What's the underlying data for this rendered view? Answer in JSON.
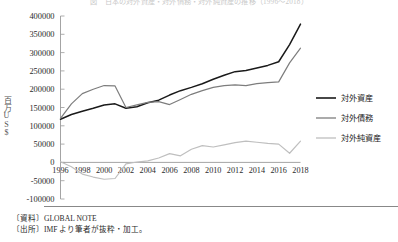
{
  "chart_data": {
    "type": "line",
    "title": "図　日本の対外資産・対外債務・対外純資産の推移（1996〜2018）",
    "xlabel": "",
    "ylabel": "百万US$",
    "ylim": [
      -100000,
      400000
    ],
    "xlim": [
      1996,
      2018
    ],
    "yticks": [
      400000,
      350000,
      300000,
      250000,
      200000,
      150000,
      100000,
      50000,
      0,
      -50000,
      -100000
    ],
    "ytick_labels": [
      "400000",
      "350000",
      "300000",
      "250000",
      "200000",
      "150000",
      "100000",
      "50000",
      "0",
      "-50000",
      "-100000"
    ],
    "xticks": [
      1996,
      1998,
      2000,
      2002,
      2004,
      2006,
      2008,
      2010,
      2012,
      2014,
      2016,
      2018
    ],
    "xtick_labels": [
      "1996",
      "1998",
      "2000",
      "2002",
      "2004",
      "2006",
      "2008",
      "2010",
      "2012",
      "2014",
      "2016",
      "2018"
    ],
    "grid": false,
    "legend_position": "right",
    "x": [
      1996,
      1997,
      1998,
      1999,
      2000,
      2001,
      2002,
      2003,
      2004,
      2005,
      2006,
      2007,
      2008,
      2009,
      2010,
      2011,
      2012,
      2013,
      2014,
      2015,
      2016,
      2017,
      2018
    ],
    "series": [
      {
        "name": "対外資産",
        "color": "#1a1a1a",
        "values": [
          118000,
          131000,
          140000,
          148000,
          157000,
          160000,
          148000,
          152000,
          163000,
          170000,
          184000,
          196000,
          205000,
          215000,
          227000,
          238000,
          248000,
          251000,
          258000,
          265000,
          275000,
          322000,
          378000
        ]
      },
      {
        "name": "対外債務",
        "color": "#7d7d7d",
        "values": [
          120000,
          160000,
          188000,
          200000,
          210000,
          209000,
          150000,
          157000,
          164000,
          166000,
          158000,
          172000,
          186000,
          196000,
          205000,
          210000,
          212000,
          210000,
          215000,
          218000,
          220000,
          272000,
          312000
        ]
      },
      {
        "name": "対外純資産",
        "color": "#bfbfbf",
        "values": [
          2000,
          -12000,
          -32000,
          -40000,
          -46000,
          -44000,
          -4000,
          1000,
          4000,
          12000,
          24000,
          18000,
          36000,
          46000,
          42000,
          48000,
          54000,
          58000,
          55000,
          52000,
          50000,
          25000,
          58000
        ]
      }
    ]
  },
  "legend": {
    "entries": [
      {
        "label": "対外資産"
      },
      {
        "label": "対外債務"
      },
      {
        "label": "対外純資産"
      }
    ]
  },
  "footer": {
    "source_material": "〔資料〕GLOBAL NOTE",
    "source_origin": "〔出所〕IMF より筆者が抜粋・加工。"
  }
}
